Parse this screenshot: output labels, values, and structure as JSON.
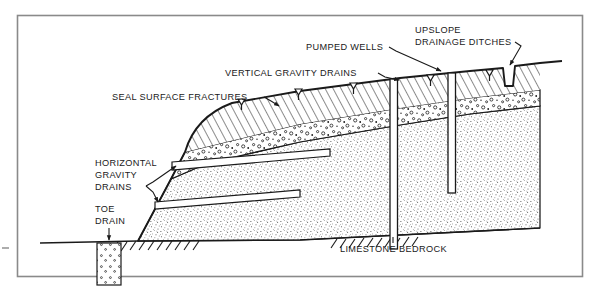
{
  "figure": {
    "frame": {
      "color": "#8a8a8a"
    }
  },
  "labels": {
    "upslope_drainage_ditches": {
      "line1": "UPSLOPE",
      "line2": "DRAINAGE DITCHES"
    },
    "pumped_wells": "PUMPED WELLS",
    "vertical_gravity_drains": "VERTICAL GRAVITY DRAINS",
    "seal_surface_fractures": "SEAL SURFACE FRACTURES",
    "horizontal_gravity_drains": {
      "line1": "HORIZONTAL",
      "line2": "GRAVITY",
      "line3": "DRAINS"
    },
    "toe_drain": {
      "line1": "TOE",
      "line2": "DRAIN"
    },
    "limestone_bedrock": "LIMESTONE BEDROCK"
  },
  "strata": [
    {
      "name": "overburden-hatched-layer",
      "pattern": "diagonal-hatch",
      "color": "#1a1a1a",
      "description": "Upper soil / weathered mantle shown with 45 degree hatching"
    },
    {
      "name": "gravel-layer",
      "pattern": "circles-and-dots",
      "color": "#1a1a1a",
      "description": "Granular gravel / colluvium shown with open circles and dots"
    },
    {
      "name": "limestone-bedrock-layer",
      "pattern": "fine-stipple",
      "color": "#1a1a1a",
      "description": "Limestone bedrock shown with fine random stipple"
    }
  ],
  "features": {
    "vertical_gravity_drains_count": 4,
    "pumped_wells_count": 2,
    "horizontal_gravity_drains_count": 2,
    "upslope_drainage_ditches_count": 1,
    "toe_drains_count": 1
  },
  "colors": {
    "ink": "#1a1a1a",
    "frame": "#8a8a8a",
    "paper": "#ffffff",
    "drain_fill": "#ffffff"
  }
}
